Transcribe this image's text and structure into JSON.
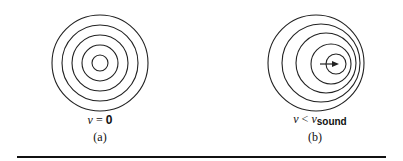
{
  "panels": [
    {
      "id": "a",
      "label_var": "v",
      "label_op": "=",
      "label_value": "0",
      "caption": "(a)",
      "center": [
        100,
        63
      ],
      "rings": [
        {
          "cx": 100,
          "cy": 63,
          "r": 48
        },
        {
          "cx": 100,
          "cy": 63,
          "r": 38
        },
        {
          "cx": 100,
          "cy": 63,
          "r": 28
        },
        {
          "cx": 100,
          "cy": 63,
          "r": 18
        },
        {
          "cx": 100,
          "cy": 63,
          "r": 8
        }
      ]
    },
    {
      "id": "b",
      "label_var": "v",
      "label_op": "<",
      "label_rhs_var": "v",
      "label_rhs_sub": "sound",
      "caption": "(b)",
      "rings": [
        {
          "cx": 316,
          "cy": 63,
          "r": 48
        },
        {
          "cx": 321,
          "cy": 63,
          "r": 39
        },
        {
          "cx": 326,
          "cy": 63,
          "r": 30
        },
        {
          "cx": 331,
          "cy": 64,
          "r": 20
        },
        {
          "cx": 336,
          "cy": 64,
          "r": 10
        }
      ],
      "arrow": {
        "x1": 320,
        "y1": 64,
        "x2": 338,
        "y2": 64
      }
    }
  ],
  "rule": {
    "x1": 17,
    "x2": 386,
    "y": 157,
    "thickness": 2
  },
  "colors": {
    "stroke": "#222222",
    "background": "#ffffff"
  }
}
